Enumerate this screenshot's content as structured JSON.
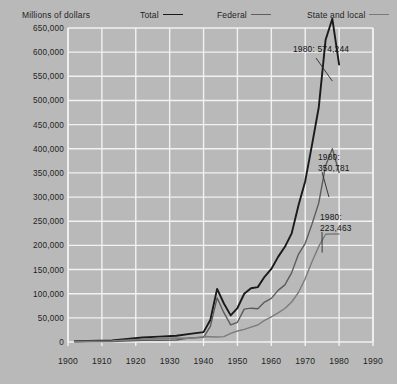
{
  "chart_data": {
    "type": "line",
    "title": "",
    "ylabel": "Millions of dollars",
    "xlabel": "",
    "xlim": [
      1900,
      1990
    ],
    "ylim": [
      0,
      650000
    ],
    "grid": true,
    "legend_position": "top",
    "x_ticks": [
      "1900",
      "1910",
      "1920",
      "1930",
      "1940",
      "1950",
      "1960",
      "1970",
      "1980",
      "1990"
    ],
    "y_ticks": [
      "0",
      "50,000",
      "100,000",
      "150,000",
      "200,000",
      "250,000",
      "300,000",
      "350,000",
      "400,000",
      "450,000",
      "500,000",
      "550,000",
      "600,000",
      "650,000"
    ],
    "series": [
      {
        "name": "Total",
        "color": "#1a1a1a",
        "x": [
          1902,
          1913,
          1922,
          1927,
          1932,
          1936,
          1940,
          1942,
          1944,
          1946,
          1948,
          1950,
          1952,
          1954,
          1956,
          1958,
          1960,
          1962,
          1964,
          1966,
          1968,
          1970,
          1972,
          1974,
          1976,
          1978,
          1980
        ],
        "values": [
          1660,
          3215,
          9297,
          11220,
          12967,
          16758,
          20417,
          45576,
          109947,
          79707,
          55081,
          70334,
          99847,
          111332,
          113587,
          134931,
          151288,
          176240,
          197000,
          224813,
          282645,
          333000,
          408000,
          486000,
          625000,
          669000,
          574244
        ]
      },
      {
        "name": "Federal",
        "color": "#5c5c5c",
        "x": [
          1902,
          1913,
          1922,
          1927,
          1932,
          1936,
          1940,
          1942,
          1944,
          1946,
          1948,
          1950,
          1952,
          1954,
          1956,
          1958,
          1960,
          1962,
          1964,
          1966,
          1968,
          1970,
          1972,
          1974,
          1976,
          1978,
          1980
        ],
        "values": [
          572,
          970,
          3763,
          3533,
          4266,
          8421,
          9589,
          32397,
          91304,
          60703,
          35592,
          40800,
          68000,
          70000,
          68900,
          82600,
          90300,
          106800,
          118200,
          143600,
          181500,
          204300,
          244000,
          288000,
          365000,
          400000,
          350781
        ]
      },
      {
        "name": "State and local",
        "color": "#7c7c7c",
        "x": [
          1902,
          1913,
          1922,
          1927,
          1932,
          1936,
          1940,
          1942,
          1944,
          1946,
          1948,
          1950,
          1952,
          1954,
          1956,
          1958,
          1960,
          1962,
          1964,
          1966,
          1968,
          1970,
          1972,
          1974,
          1976,
          1978,
          1980
        ],
        "values": [
          1095,
          2257,
          5652,
          7810,
          8403,
          7644,
          11240,
          10914,
          10500,
          11028,
          17684,
          22787,
          26098,
          30701,
          35114,
          44851,
          51876,
          60206,
          69302,
          82843,
          102411,
          131300,
          166000,
          198000,
          223000,
          223463,
          223463
        ]
      }
    ],
    "annotations": [
      {
        "id": "total",
        "text": "1980: 574,244",
        "series": "Total"
      },
      {
        "id": "federal",
        "line1": "1980:",
        "line2": "350,781",
        "series": "Federal"
      },
      {
        "id": "state",
        "line1": "1980:",
        "line2": "223,463",
        "series": "State and local"
      }
    ],
    "legend": [
      {
        "label": "Total",
        "color": "#1a1a1a"
      },
      {
        "label": "Federal",
        "color": "#5c5c5c"
      },
      {
        "label": "State and local",
        "color": "#7c7c7c"
      }
    ]
  },
  "colors": {
    "background": "#b9b9b9",
    "gridline": "#f2f2f2",
    "total": "#1a1a1a",
    "federal": "#5c5c5c",
    "state": "#7c7c7c"
  }
}
